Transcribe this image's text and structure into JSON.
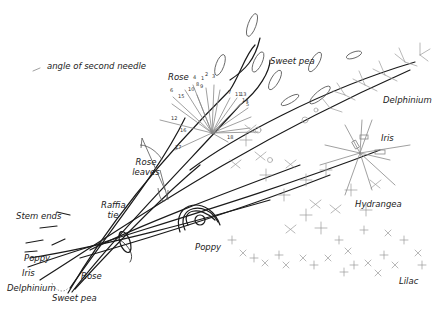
{
  "legend": {
    "label": "angle of second needle"
  },
  "labels": {
    "rose": "Rose",
    "sweet_pea": "Sweet pea",
    "delphinium": "Delphinium",
    "iris": "Iris",
    "rose_leaves": "Rose leaves",
    "raffia_tie": "Raffia tie",
    "hydrangea": "Hydrangea",
    "poppy": "Poppy",
    "lilac": "Lilac",
    "stem_ends": "Stem ends",
    "stem_poppy": "Poppy",
    "stem_iris": "Iris",
    "stem_delphinium": "Delphinium",
    "stem_sweet_pea": "Sweet pea",
    "stem_rose": "Rose"
  },
  "rose_numbers": [
    "1",
    "2",
    "3",
    "4",
    "5",
    "6",
    "7",
    "8",
    "9",
    "10",
    "11",
    "12",
    "13",
    "14",
    "15",
    "16",
    "17",
    "18"
  ],
  "colors": {
    "stem": "#1a1a1a",
    "leaf": "#555555",
    "grey": "#888888",
    "text": "#222222"
  }
}
